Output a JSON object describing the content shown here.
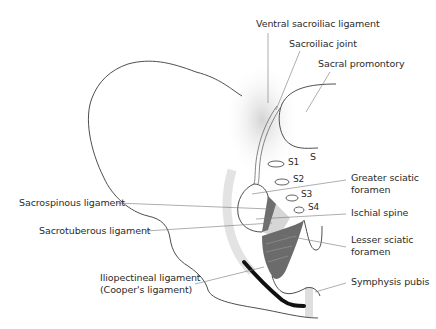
{
  "diagram": {
    "type": "anatomical-illustration",
    "labels": {
      "ventral_sacroiliac": "Ventral sacroiliac ligament",
      "sacroiliac_joint": "Sacroiliac joint",
      "sacral_promontory": "Sacral promontory",
      "s": "S",
      "s1": "S1",
      "s2": "S2",
      "s3": "S3",
      "s4": "S4",
      "greater_sciatic_1": "Greater sciatic",
      "greater_sciatic_2": "foramen",
      "ischial_spine": "Ischial spine",
      "lesser_sciatic_1": "Lesser sciatic",
      "lesser_sciatic_2": "foramen",
      "symphysis_pubis": "Symphysis pubis",
      "sacrospinous": "Sacrospinous ligament",
      "sacrotuberous": "Sacrotuberous ligament",
      "iliopectineal_1": "Iliopectineal ligament",
      "iliopectineal_2": "(Cooper's ligament)"
    },
    "colors": {
      "outline": "#3a3a3a",
      "shading": "#d6d6d6",
      "ligament_dark": "#6e6e6e",
      "ligament_light": "#bdbdbd",
      "cooper": "#111111",
      "text": "#2b2b2b"
    }
  }
}
